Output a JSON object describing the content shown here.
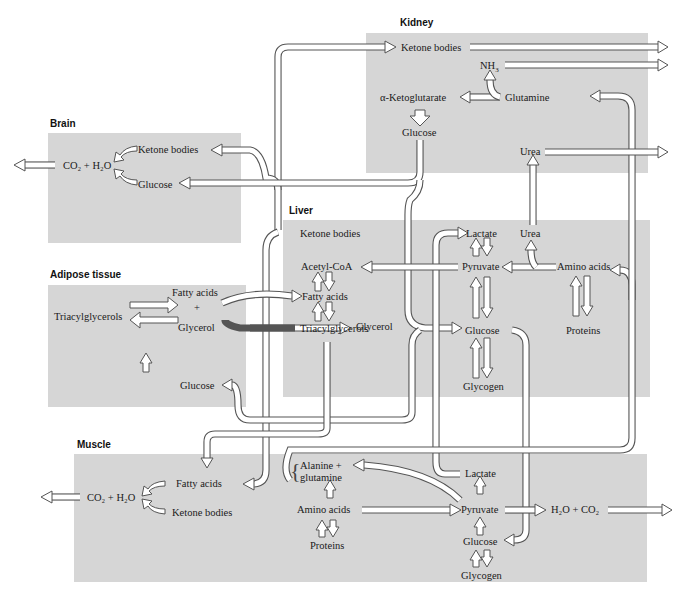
{
  "organs": {
    "kidney": {
      "title": "Kidney",
      "labels": {
        "ketone_bodies": "Ketone bodies",
        "nh3": "NH",
        "nh3_sub": "3",
        "alpha_ketoglutarate": "α-Ketoglutarate",
        "glutamine": "Glutamine",
        "glucose": "Glucose",
        "urea": "Urea"
      }
    },
    "brain": {
      "title": "Brain",
      "labels": {
        "ketone_bodies": "Ketone bodies",
        "glucose": "Glucose",
        "co2_h2o": "CO₂ + H₂O"
      }
    },
    "adipose": {
      "title": "Adipose tissue",
      "labels": {
        "fatty_acids": "Fatty acids",
        "plus": "+",
        "triacylglycerols": "Triacylglycerols",
        "glycerol": "Glycerol",
        "glucose": "Glucose"
      }
    },
    "liver": {
      "title": "Liver",
      "labels": {
        "ketone_bodies": "Ketone bodies",
        "acetyl_coa": "Acetyl-CoA",
        "fatty_acids": "Fatty acids",
        "triacylglycerols": "Triacylglycerols",
        "glycerol": "Glycerol",
        "lactate": "Lactate",
        "pyruvate": "Pyruvate",
        "urea": "Urea",
        "amino_acids": "Amino acids",
        "glucose": "Glucose",
        "proteins": "Proteins",
        "glycogen": "Glycogen"
      }
    },
    "muscle": {
      "title": "Muscle",
      "labels": {
        "fatty_acids": "Fatty acids",
        "co2_h2o": "CO₂ + H₂O",
        "ketone_bodies": "Ketone bodies",
        "alanine": "Alanine +",
        "glutamine": "glutamine",
        "amino_acids": "Amino acids",
        "proteins": "Proteins",
        "lactate": "Lactate",
        "pyruvate": "Pyruvate",
        "glucose": "Glucose",
        "glycogen": "Glycogen",
        "h2o_co2": "H₂O + CO₂"
      }
    }
  },
  "colors": {
    "organ_background": "#d6d6d6",
    "arrow_fill": "#ffffff",
    "arrow_outline": "#555555",
    "text": "#1a1a1a"
  }
}
